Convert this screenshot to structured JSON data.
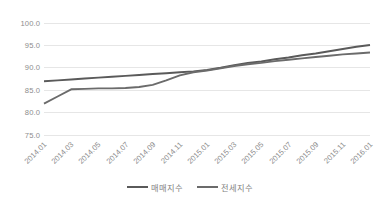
{
  "chart_data": {
    "type": "line",
    "title": "",
    "xlabel": "",
    "ylabel": "",
    "ylim": [
      75.0,
      100.0
    ],
    "ytick_step": 5.0,
    "yticks": [
      "100.0",
      "95.0",
      "90.0",
      "85.0",
      "80.0",
      "75.0"
    ],
    "ytick_values": [
      100.0,
      95.0,
      90.0,
      85.0,
      80.0,
      75.0
    ],
    "grid": true,
    "grid_axis": "y",
    "legend_position": "bottom",
    "categories": [
      "2014.01",
      "2014.02",
      "2014.03",
      "2014.04",
      "2014.05",
      "2014.06",
      "2014.07",
      "2014.08",
      "2014.09",
      "2014.10",
      "2014.11",
      "2014.12",
      "2015.01",
      "2015.02",
      "2015.03",
      "2015.04",
      "2015.05",
      "2015.06",
      "2015.07",
      "2015.08",
      "2015.09",
      "2015.10",
      "2015.11",
      "2015.12",
      "2016.01"
    ],
    "xtick_labels": [
      "2014.01",
      "2014.03",
      "2014.05",
      "2014.07",
      "2014.09",
      "2014.11",
      "2015.01",
      "2015.03",
      "2015.05",
      "2015.07",
      "2015.09",
      "2015.11",
      "2016.01"
    ],
    "series": [
      {
        "name": "매매지수",
        "color": "#5a5a5a",
        "values": [
          87.0,
          87.2,
          87.4,
          87.6,
          87.8,
          88.0,
          88.2,
          88.4,
          88.6,
          88.8,
          89.0,
          89.2,
          89.5,
          90.0,
          90.6,
          91.1,
          91.4,
          91.9,
          92.3,
          92.8,
          93.2,
          93.7,
          94.2,
          94.7,
          95.1
        ]
      },
      {
        "name": "전세지수",
        "color": "#6b6b6b",
        "values": [
          82.0,
          83.6,
          85.2,
          85.3,
          85.4,
          85.4,
          85.5,
          85.7,
          86.2,
          87.2,
          88.3,
          89.0,
          89.4,
          89.9,
          90.4,
          90.8,
          91.1,
          91.5,
          91.8,
          92.1,
          92.4,
          92.7,
          93.0,
          93.2,
          93.4
        ]
      }
    ]
  },
  "legend": {
    "entries": [
      {
        "label": "매매지수"
      },
      {
        "label": "전세지수"
      }
    ]
  },
  "colors": {
    "series_1": "#5a5a5a",
    "series_2": "#6b6b6b",
    "gridline": "#e6e6e6",
    "tick_text": "#8c8c8c",
    "legend_text": "#7f7f7f",
    "background": "#ffffff"
  }
}
